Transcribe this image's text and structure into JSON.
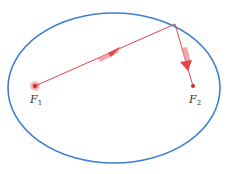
{
  "diagram": {
    "colors": {
      "ellipse": "#3f7fcf",
      "ray": "#e0454a",
      "arrow": "#e8555a",
      "focus": "#d42a2a",
      "label": "#333333"
    },
    "foci": [
      {
        "id": "F1",
        "label": "F",
        "subscript": "1",
        "type": "source"
      },
      {
        "id": "F2",
        "label": "F",
        "subscript": "2",
        "type": "target"
      }
    ],
    "rays": [
      {
        "from": "F1",
        "to": "reflection-point",
        "arrow": true
      },
      {
        "from": "reflection-point",
        "to": "F2",
        "arrow": true
      }
    ]
  }
}
